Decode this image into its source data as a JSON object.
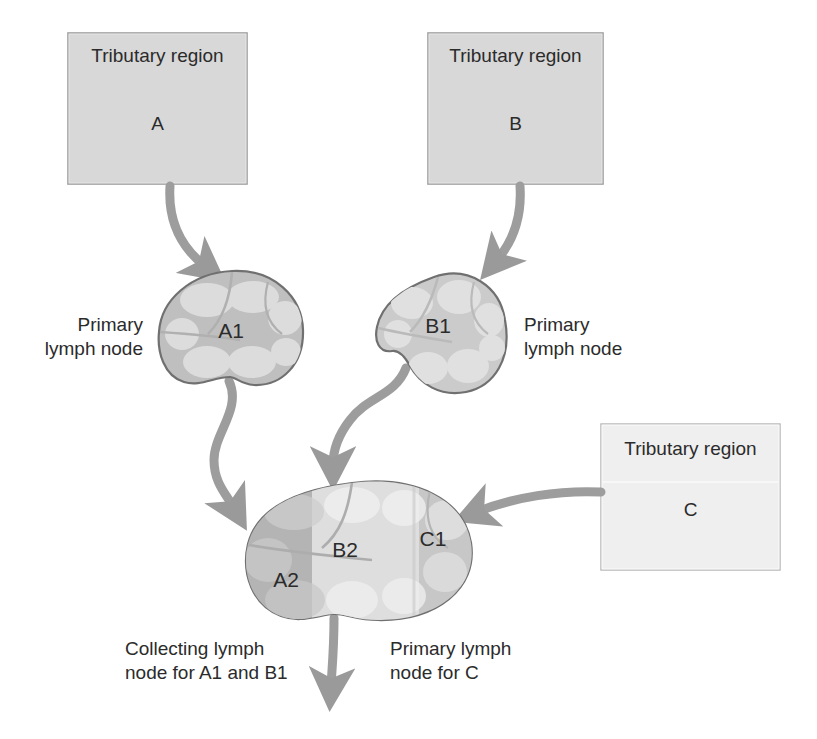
{
  "figure": {
    "type": "diagram",
    "colors": {
      "background": "#ffffff",
      "box_fill": "#d6d6d6",
      "box_fill_light": "#e4e4e4",
      "box_border": "#9a9a9a",
      "arrow": "#9a9a9a",
      "node_outline": "#6f6f6f",
      "node_capsule_a1": "#bcbcbc",
      "node_capsule_b1": "#c9c9c9",
      "node_medulla": "#d8d8d8",
      "zone_a2": "#b4b4b4",
      "zone_b2": "#dcdcdc",
      "zone_c1": "#c8c8c8",
      "text": "#2b2b2b"
    }
  },
  "regions": [
    {
      "id": "A",
      "title": "Tributary region",
      "letter": "A"
    },
    {
      "id": "B",
      "title": "Tributary region",
      "letter": "B"
    },
    {
      "id": "C",
      "title": "Tributary region",
      "letter": "C"
    }
  ],
  "nodes": [
    {
      "id": "A1",
      "label": "A1",
      "kind": "primary-lymph-node"
    },
    {
      "id": "B1",
      "label": "B1",
      "kind": "primary-lymph-node"
    },
    {
      "id": "A2",
      "label": "A2",
      "kind": "zone-of-collecting-node"
    },
    {
      "id": "B2",
      "label": "B2",
      "kind": "zone-of-collecting-node"
    },
    {
      "id": "C1",
      "label": "C1",
      "kind": "zone-of-collecting-node"
    }
  ],
  "captions": {
    "primary_left": "Primary\nlymph node",
    "primary_right": "Primary\nlymph node",
    "collecting": "Collecting lymph\nnode for A1 and B1",
    "primary_for_c": "Primary lymph\nnode for C"
  },
  "flows": [
    {
      "from": "A",
      "to": "A1",
      "style": "curved-arrow"
    },
    {
      "from": "B",
      "to": "B1",
      "style": "curved-arrow"
    },
    {
      "from": "A1",
      "to": "A2",
      "style": "curved-arrow"
    },
    {
      "from": "B1",
      "to": "B2",
      "style": "curved-arrow"
    },
    {
      "from": "C",
      "to": "C1",
      "style": "curved-arrow"
    },
    {
      "from": "collecting-node",
      "to": "efferent",
      "style": "straight-arrow"
    }
  ]
}
